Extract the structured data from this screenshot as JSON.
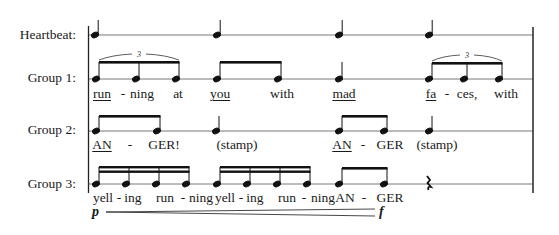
{
  "rows": [
    {
      "label": "Heartbeat:",
      "staff_y": 35
    },
    {
      "label": "Group 1:",
      "staff_y": 79
    },
    {
      "label": "Group 2:",
      "staff_y": 131
    },
    {
      "label": "Group 3:",
      "staff_y": 184
    }
  ],
  "group1": {
    "tuplet_marks": [
      "3",
      "3"
    ],
    "lyrics": [
      {
        "text": "run",
        "x": 102,
        "underline": true
      },
      {
        "text": "-",
        "x": 123,
        "underline": false
      },
      {
        "text": "ning",
        "x": 140,
        "underline": false
      },
      {
        "text": "at",
        "x": 178,
        "underline": false
      },
      {
        "text": "you",
        "x": 217,
        "underline": true
      },
      {
        "text": "with",
        "x": 278,
        "underline": false
      },
      {
        "text": "mad",
        "x": 343,
        "underline": true
      },
      {
        "text": "fa",
        "x": 432,
        "underline": true
      },
      {
        "text": "-",
        "x": 448,
        "underline": false
      },
      {
        "text": "ces,",
        "x": 466,
        "underline": false
      },
      {
        "text": "with",
        "x": 507,
        "underline": false
      }
    ]
  },
  "group2": {
    "lyrics": [
      {
        "text": "AN",
        "x": 102,
        "underline": true
      },
      {
        "text": "-",
        "x": 130,
        "underline": false
      },
      {
        "text": "GER!",
        "x": 164,
        "underline": false
      },
      {
        "text": "(stamp)",
        "x": 240,
        "underline": false
      },
      {
        "text": "AN",
        "x": 343,
        "underline": true
      },
      {
        "text": "-",
        "x": 363,
        "underline": false
      },
      {
        "text": "GER",
        "x": 390,
        "underline": false
      },
      {
        "text": "(stamp)",
        "x": 446,
        "underline": false
      }
    ]
  },
  "group3": {
    "lyrics": [
      {
        "text": "yell",
        "x": 103,
        "underline": false
      },
      {
        "text": "-",
        "x": 120,
        "underline": false
      },
      {
        "text": "ing",
        "x": 133,
        "underline": false
      },
      {
        "text": "run",
        "x": 166,
        "underline": false
      },
      {
        "text": "-",
        "x": 184,
        "underline": false
      },
      {
        "text": "ning",
        "x": 202,
        "underline": false
      },
      {
        "text": "yell",
        "x": 226,
        "underline": false
      },
      {
        "text": "-",
        "x": 242,
        "underline": false
      },
      {
        "text": "ing",
        "x": 255,
        "underline": false
      },
      {
        "text": "run",
        "x": 288,
        "underline": false
      },
      {
        "text": "-",
        "x": 305,
        "underline": false
      },
      {
        "text": "ning",
        "x": 323,
        "underline": false
      },
      {
        "text": "AN",
        "x": 345,
        "underline": false
      },
      {
        "text": "-",
        "x": 364,
        "underline": false
      },
      {
        "text": "GER",
        "x": 390,
        "underline": false
      }
    ]
  },
  "dynamics": {
    "start": "p",
    "end": "f"
  }
}
